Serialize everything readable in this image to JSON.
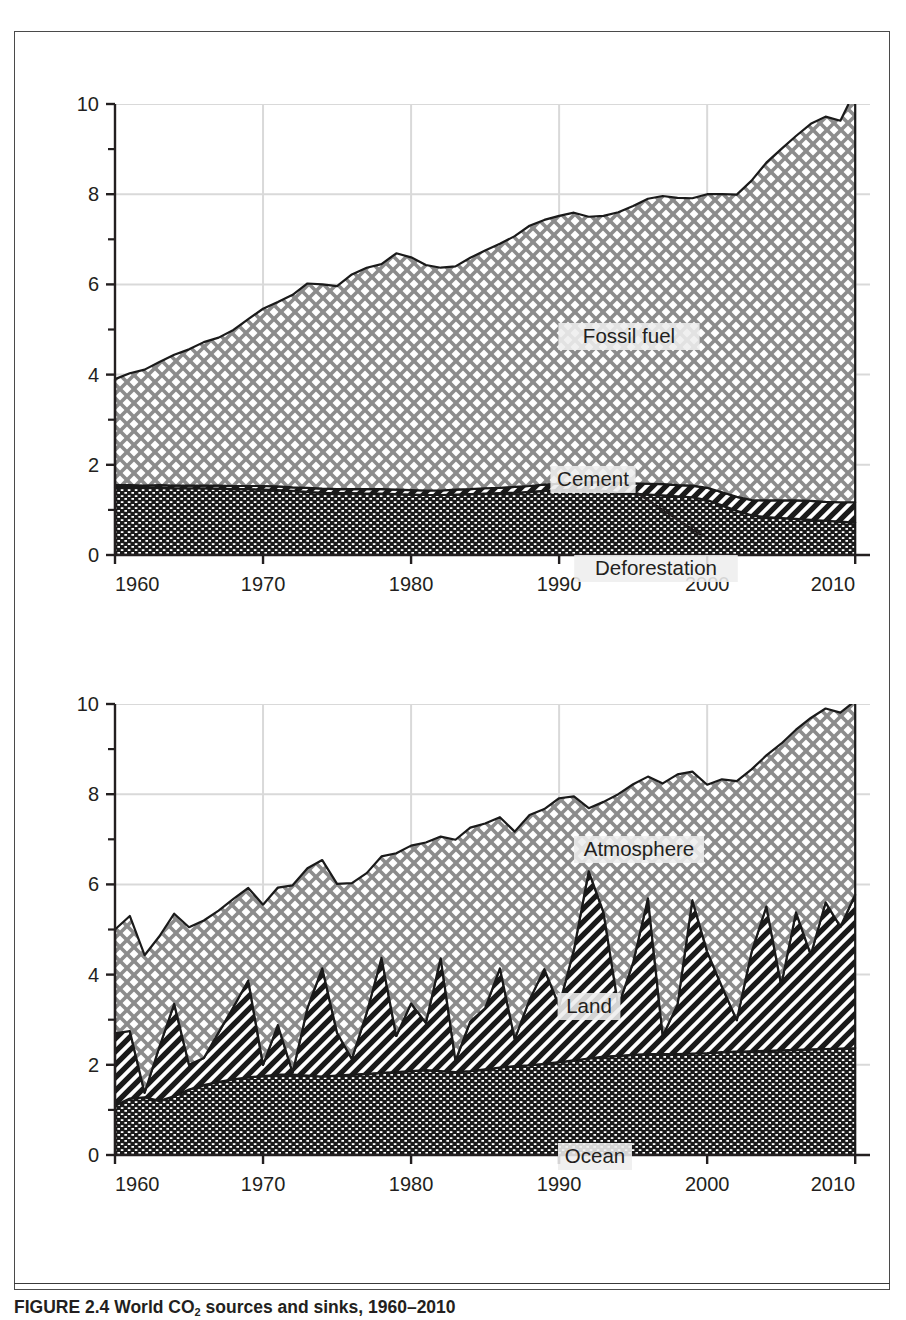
{
  "figure": {
    "caption_prefix": "FIGURE 2.4",
    "caption_text": " World CO",
    "caption_sub": "2",
    "caption_rest": " sources and sinks, 1960–2010",
    "caption_full": "FIGURE 2.4 World CO2 sources and sinks, 1960–2010"
  },
  "colors": {
    "ink": "#231f20",
    "frame": "#4a4a4a",
    "grid": "#d9d9d9",
    "hatch_light": "#8c8c8c",
    "hatch_dark": "#1a1a1a",
    "label_bg": "#eeeeee"
  },
  "charts": [
    {
      "id": "sources",
      "title_main": "CO",
      "title_sub": "2",
      "title_rest": " sources",
      "title_full": "CO2 sources",
      "yaxis": {
        "label": "",
        "ticks": [
          "0",
          "2",
          "4",
          "6",
          "8",
          "10"
        ],
        "tickvals": [
          0,
          2,
          4,
          6,
          8,
          10
        ],
        "minor": [
          1,
          3,
          5,
          7,
          9
        ],
        "range": [
          0,
          10
        ]
      },
      "xaxis": {
        "label": "",
        "ticks": [
          "1960",
          "1970",
          "1980",
          "1990",
          "2000",
          "2010"
        ],
        "tickvals": [
          1960,
          1970,
          1980,
          1990,
          2000,
          2010
        ],
        "range": [
          1960,
          2011
        ]
      },
      "series_labels": [
        {
          "name": "Fossil fuel",
          "x": 628,
          "y": 342
        },
        {
          "name": "Cement",
          "x": 592,
          "y": 485
        },
        {
          "name": "Deforestation",
          "x": 655,
          "y": 574
        }
      ],
      "leader": {
        "from_x": 636,
        "from_y": 492,
        "to_x": 700,
        "to_y": 534
      }
    },
    {
      "id": "sinks",
      "title_main": "CO",
      "title_sub": "2",
      "title_rest": " sinks",
      "title_full": "CO2 sinks",
      "yaxis": {
        "label": "",
        "ticks": [
          "0",
          "2",
          "4",
          "6",
          "8",
          "10"
        ],
        "tickvals": [
          0,
          2,
          4,
          6,
          8,
          10
        ],
        "minor": [
          1,
          3,
          5,
          7,
          9
        ],
        "range": [
          0,
          10
        ]
      },
      "xaxis": {
        "label": "",
        "ticks": [
          "1960",
          "1970",
          "1980",
          "1990",
          "2000",
          "2010"
        ],
        "tickvals": [
          1960,
          1970,
          1980,
          1990,
          2000,
          2010
        ],
        "range": [
          1960,
          2011
        ]
      },
      "series_labels": [
        {
          "name": "Atmosphere",
          "x": 638,
          "y": 855
        },
        {
          "name": "Land",
          "x": 588,
          "y": 1012
        },
        {
          "name": "Ocean",
          "x": 594,
          "y": 1162
        }
      ]
    }
  ],
  "chart_data": [
    {
      "type": "area",
      "id": "sources",
      "title": "CO2 sources",
      "xlabel": "",
      "ylabel": "",
      "stacked": true,
      "grid": true,
      "legend_position": "inline-annotations",
      "xlim": [
        1960,
        2011
      ],
      "ylim": [
        0,
        10
      ],
      "x": [
        1960,
        1961,
        1962,
        1963,
        1964,
        1965,
        1966,
        1967,
        1968,
        1969,
        1970,
        1971,
        1972,
        1973,
        1974,
        1975,
        1976,
        1977,
        1978,
        1979,
        1980,
        1981,
        1982,
        1983,
        1984,
        1985,
        1986,
        1987,
        1988,
        1989,
        1990,
        1991,
        1992,
        1993,
        1994,
        1995,
        1996,
        1997,
        1998,
        1999,
        2000,
        2001,
        2002,
        2003,
        2004,
        2005,
        2006,
        2007,
        2008,
        2009,
        2010
      ],
      "series": [
        {
          "name": "Deforestation",
          "pattern": "dark-checker",
          "values": [
            1.5,
            1.5,
            1.49,
            1.49,
            1.48,
            1.48,
            1.48,
            1.47,
            1.46,
            1.46,
            1.45,
            1.44,
            1.42,
            1.4,
            1.38,
            1.37,
            1.37,
            1.36,
            1.36,
            1.35,
            1.34,
            1.33,
            1.33,
            1.34,
            1.35,
            1.36,
            1.37,
            1.38,
            1.4,
            1.42,
            1.44,
            1.45,
            1.44,
            1.42,
            1.38,
            1.36,
            1.34,
            1.32,
            1.3,
            1.28,
            1.22,
            1.1,
            0.98,
            0.88,
            0.84,
            0.82,
            0.8,
            0.78,
            0.76,
            0.74,
            0.72
          ]
        },
        {
          "name": "Cement",
          "pattern": "diagonal-stripe-bold",
          "values": [
            0.05,
            0.05,
            0.05,
            0.06,
            0.06,
            0.06,
            0.06,
            0.07,
            0.07,
            0.07,
            0.08,
            0.08,
            0.08,
            0.09,
            0.09,
            0.09,
            0.09,
            0.1,
            0.1,
            0.1,
            0.1,
            0.1,
            0.1,
            0.11,
            0.11,
            0.12,
            0.12,
            0.13,
            0.13,
            0.14,
            0.14,
            0.15,
            0.17,
            0.2,
            0.22,
            0.23,
            0.24,
            0.25,
            0.25,
            0.26,
            0.27,
            0.29,
            0.31,
            0.34,
            0.37,
            0.39,
            0.41,
            0.42,
            0.42,
            0.43,
            0.45
          ]
        },
        {
          "name": "Fossil fuel",
          "pattern": "crosshatch-light",
          "values": [
            2.35,
            2.48,
            2.57,
            2.73,
            2.9,
            3.02,
            3.18,
            3.28,
            3.46,
            3.7,
            3.93,
            4.09,
            4.27,
            4.53,
            4.53,
            4.5,
            4.76,
            4.91,
            4.99,
            5.24,
            5.16,
            5.0,
            4.94,
            4.95,
            5.13,
            5.27,
            5.41,
            5.56,
            5.77,
            5.87,
            5.94,
            5.99,
            5.89,
            5.9,
            6.0,
            6.15,
            6.32,
            6.39,
            6.37,
            6.37,
            6.51,
            6.61,
            6.7,
            7.08,
            7.49,
            7.79,
            8.08,
            8.36,
            8.54,
            8.46,
            9.13
          ]
        }
      ],
      "totals": [
        3.9,
        4.03,
        4.11,
        4.28,
        4.44,
        4.56,
        4.72,
        4.82,
        4.99,
        5.23,
        5.46,
        5.61,
        5.77,
        6.02,
        6.0,
        5.96,
        6.22,
        6.37,
        6.45,
        6.69,
        6.6,
        6.43,
        6.37,
        6.4,
        6.59,
        6.75,
        6.9,
        7.07,
        7.3,
        7.43,
        7.52,
        7.59,
        7.5,
        7.52,
        7.6,
        7.74,
        7.9,
        7.96,
        7.92,
        7.91,
        8.0,
        8.0,
        7.99,
        8.3,
        8.7,
        9.0,
        9.29,
        9.56,
        9.72,
        9.63,
        10.3
      ]
    },
    {
      "type": "area",
      "id": "sinks",
      "title": "CO2 sinks",
      "xlabel": "",
      "ylabel": "",
      "stacked": true,
      "grid": true,
      "legend_position": "inline-annotations",
      "xlim": [
        1960,
        2011
      ],
      "ylim": [
        0,
        10
      ],
      "x": [
        1960,
        1961,
        1962,
        1963,
        1964,
        1965,
        1966,
        1967,
        1968,
        1969,
        1970,
        1971,
        1972,
        1973,
        1974,
        1975,
        1976,
        1977,
        1978,
        1979,
        1980,
        1981,
        1982,
        1983,
        1984,
        1985,
        1986,
        1987,
        1988,
        1989,
        1990,
        1991,
        1992,
        1993,
        1994,
        1995,
        1996,
        1997,
        1998,
        1999,
        2000,
        2001,
        2002,
        2003,
        2004,
        2005,
        2006,
        2007,
        2008,
        2009,
        2010
      ],
      "series": [
        {
          "name": "Ocean",
          "pattern": "dark-checker",
          "values": [
            1.1,
            1.25,
            1.28,
            1.2,
            1.3,
            1.45,
            1.55,
            1.62,
            1.68,
            1.72,
            1.75,
            1.78,
            1.78,
            1.76,
            1.74,
            1.76,
            1.78,
            1.8,
            1.82,
            1.84,
            1.86,
            1.88,
            1.86,
            1.84,
            1.86,
            1.9,
            1.94,
            1.97,
            1.99,
            2.02,
            2.06,
            2.1,
            2.14,
            2.18,
            2.2,
            2.22,
            2.24,
            2.24,
            2.24,
            2.25,
            2.26,
            2.28,
            2.29,
            2.3,
            2.31,
            2.32,
            2.33,
            2.34,
            2.35,
            2.36,
            2.37
          ]
        },
        {
          "name": "Land",
          "pattern": "diagonal-stripe-bold",
          "values": [
            1.6,
            1.5,
            0.1,
            1.2,
            2.05,
            0.55,
            0.6,
            1.1,
            1.6,
            2.15,
            0.25,
            1.1,
            0.05,
            1.5,
            2.4,
            0.95,
            0.35,
            1.35,
            2.55,
            0.8,
            1.5,
            1.05,
            2.5,
            0.25,
            1.1,
            1.35,
            2.2,
            0.6,
            1.45,
            2.1,
            1.25,
            2.45,
            4.15,
            3.2,
            1.1,
            2.05,
            3.45,
            0.4,
            1.1,
            3.4,
            2.25,
            1.45,
            0.7,
            2.2,
            3.2,
            1.45,
            3.05,
            2.1,
            3.25,
            2.7,
            3.4
          ]
        },
        {
          "name": "Atmosphere",
          "pattern": "crosshatch-light",
          "values": [
            2.3,
            2.55,
            3.05,
            2.45,
            2.0,
            3.05,
            3.05,
            2.7,
            2.4,
            2.05,
            3.55,
            3.05,
            4.15,
            3.1,
            2.4,
            3.3,
            3.9,
            3.1,
            2.25,
            4.05,
            3.5,
            4.0,
            2.7,
            4.9,
            4.3,
            4.1,
            3.35,
            4.6,
            4.1,
            3.55,
            4.6,
            3.4,
            1.4,
            2.45,
            4.7,
            3.95,
            2.7,
            5.6,
            5.1,
            2.85,
            3.7,
            4.6,
            5.3,
            4.05,
            3.35,
            5.35,
            4.05,
            5.25,
            4.3,
            4.75,
            4.3
          ]
        }
      ],
      "totals": [
        5.0,
        5.3,
        4.43,
        4.85,
        5.35,
        5.05,
        5.2,
        5.42,
        5.68,
        5.92,
        5.55,
        5.93,
        5.98,
        6.36,
        6.54,
        6.01,
        6.03,
        6.25,
        6.62,
        6.69,
        6.86,
        6.93,
        7.06,
        6.99,
        7.26,
        7.35,
        7.49,
        7.17,
        7.54,
        7.67,
        7.91,
        7.95,
        7.69,
        7.83,
        8.0,
        8.22,
        8.39,
        8.24,
        8.44,
        8.5,
        8.21,
        8.33,
        8.29,
        8.55,
        8.86,
        9.12,
        9.43,
        9.69,
        9.9,
        9.81,
        10.07
      ]
    }
  ]
}
